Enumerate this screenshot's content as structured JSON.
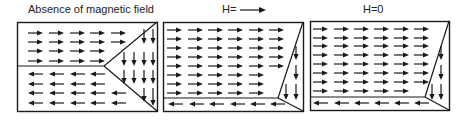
{
  "panels": [
    {
      "id": "p1",
      "title": "Absence of magnetic field",
      "box": {
        "x": 17,
        "y": 22,
        "w": 140,
        "h": 89
      },
      "lines": [
        [
          17,
          66,
          104,
          66
        ],
        [
          104,
          66,
          157,
          22
        ],
        [
          104,
          66,
          157,
          111
        ]
      ],
      "arrows": {
        "right": {
          "xs": [
            28,
            49,
            70,
            90,
            111
          ],
          "ys": [
            33,
            42,
            51,
            61
          ],
          "len": 15,
          "limits": [
            5,
            5,
            4,
            4
          ]
        },
        "left": {
          "xs": [
            28,
            49,
            70,
            90,
            111
          ],
          "ys": [
            74,
            84,
            93,
            103
          ],
          "len": 15,
          "limits": [
            4,
            4,
            5,
            5
          ]
        },
        "down": [
          [
            144,
            29,
            44
          ],
          [
            153,
            29,
            44
          ],
          [
            124,
            52,
            66
          ],
          [
            134,
            52,
            66
          ],
          [
            144,
            52,
            66
          ],
          [
            153,
            52,
            66
          ],
          [
            124,
            70,
            84
          ],
          [
            134,
            70,
            84
          ],
          [
            144,
            70,
            84
          ],
          [
            153,
            70,
            84
          ],
          [
            144,
            88,
            102
          ],
          [
            153,
            88,
            106
          ]
        ]
      }
    },
    {
      "id": "p2",
      "title": "H=",
      "title_arrow": true,
      "box": {
        "x": 163,
        "y": 22,
        "w": 140,
        "h": 89
      },
      "lines": [
        [
          163,
          98,
          278,
          98
        ],
        [
          278,
          98,
          303,
          22
        ],
        [
          278,
          98,
          303,
          111
        ]
      ],
      "arrows": {
        "right": {
          "xs": [
            167,
            188,
            208,
            228,
            249,
            269
          ],
          "ys": [
            30,
            39,
            48,
            57,
            66,
            75,
            84,
            93
          ],
          "len": 15,
          "limits": [
            6,
            6,
            6,
            6,
            6,
            5,
            5,
            5
          ]
        },
        "left": {
          "xs": [
            168,
            189,
            209,
            230,
            250,
            270
          ],
          "ys": [
            104
          ],
          "len": 15,
          "limits": [
            6
          ]
        },
        "down": [
          [
            296,
            46,
            60
          ],
          [
            296,
            65,
            80
          ],
          [
            286,
            84,
            100
          ],
          [
            296,
            84,
            100
          ]
        ]
      }
    },
    {
      "id": "p3",
      "title": "H=0",
      "box": {
        "x": 310,
        "y": 21,
        "w": 139,
        "h": 89
      },
      "lines": [
        [
          310,
          97,
          425,
          97
        ],
        [
          425,
          97,
          449,
          21
        ],
        [
          425,
          97,
          449,
          110
        ]
      ],
      "arrows": {
        "right": {
          "xs": [
            313,
            334,
            354,
            374,
            394,
            414
          ],
          "ys": [
            29,
            38,
            46,
            55,
            64,
            73,
            82,
            91
          ],
          "len": 15,
          "limits": [
            6,
            6,
            6,
            6,
            6,
            6,
            6,
            5
          ]
        },
        "left": {
          "xs": [
            313,
            334,
            354,
            374,
            394,
            414
          ],
          "ys": [
            103
          ],
          "len": 15,
          "limits": [
            6
          ]
        },
        "down": [
          [
            441,
            46,
            60
          ],
          [
            441,
            65,
            80
          ],
          [
            432,
            84,
            100
          ],
          [
            441,
            84,
            100
          ]
        ]
      }
    }
  ],
  "colors": {
    "stroke": "#1a1a1a",
    "background": "#ffffff"
  }
}
